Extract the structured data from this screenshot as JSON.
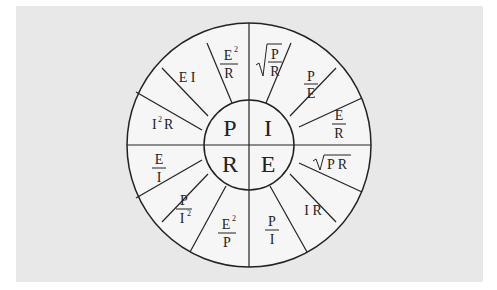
{
  "diagram": {
    "colors": {
      "background": "#e8e8e8",
      "segment_fill": "#f6f6f6",
      "stroke": "#222222"
    },
    "center": {
      "quadrants": [
        {
          "letter": "P",
          "position": "top-left"
        },
        {
          "letter": "I",
          "position": "top-right"
        },
        {
          "letter": "R",
          "position": "bottom-left"
        },
        {
          "letter": "E",
          "position": "bottom-right"
        }
      ]
    },
    "segments": [
      {
        "quantity": "P",
        "formula": "E²/R"
      },
      {
        "quantity": "P",
        "formula": "E I"
      },
      {
        "quantity": "P",
        "formula": "I²R"
      },
      {
        "quantity": "I",
        "formula": "√(P/R)"
      },
      {
        "quantity": "I",
        "formula": "P/E"
      },
      {
        "quantity": "I",
        "formula": "E/R"
      },
      {
        "quantity": "E",
        "formula": "√(PR)"
      },
      {
        "quantity": "E",
        "formula": "I R"
      },
      {
        "quantity": "E",
        "formula": "P/I"
      },
      {
        "quantity": "R",
        "formula": "E²/P"
      },
      {
        "quantity": "R",
        "formula": "P/I²"
      },
      {
        "quantity": "R",
        "formula": "E/I"
      }
    ],
    "text": {
      "P": "P",
      "I": "I",
      "R": "R",
      "E": "E",
      "ei": "E I",
      "ir": "I R",
      "i2r_I": "I",
      "i2r_2": "2",
      "i2r_R": "R",
      "num_E": "E",
      "num_P": "P",
      "sup2": "2",
      "den_R": "R",
      "den_E": "E",
      "den_I": "I",
      "den_P": "P",
      "pr": "P R"
    }
  }
}
